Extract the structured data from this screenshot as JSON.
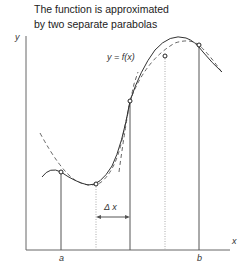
{
  "title": {
    "line1": "The function is approximated",
    "line2": "by two separate parabolas"
  },
  "labels": {
    "y_axis": "y",
    "x_axis": "x",
    "function": "y = f(x)",
    "delta": "Δ x",
    "a": "a",
    "b": "b"
  },
  "diagram": {
    "sample_points_count": 5,
    "subintervals": 4,
    "colors": {
      "curve": "#333333",
      "dashed": "#555555",
      "dotted": "#999999",
      "axis": "#555555"
    }
  }
}
